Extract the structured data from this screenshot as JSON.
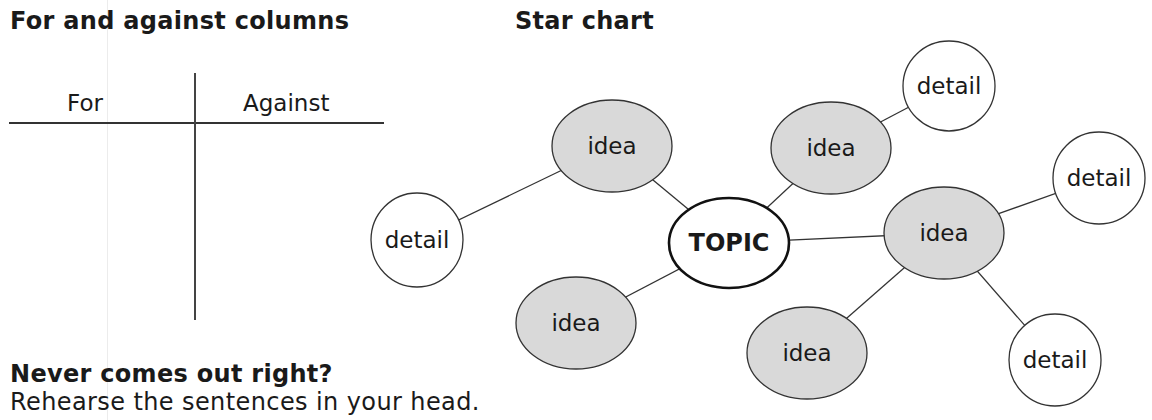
{
  "sections": {
    "for_against": {
      "title": "For and against columns",
      "columns": [
        "For",
        "Against"
      ]
    },
    "star_chart": {
      "title": "Star chart"
    },
    "tip": {
      "title": "Never comes out right?",
      "body": "Rehearse the sentences in your head."
    }
  },
  "colors": {
    "idea_fill": "#d9d9d9",
    "detail_fill": "#ffffff",
    "stroke": "#333333"
  },
  "diagram": {
    "nodes": [
      {
        "id": "topic",
        "label": "TOPIC",
        "type": "topic",
        "cx": 729,
        "cy": 243,
        "rx": 60,
        "ry": 45
      },
      {
        "id": "idea1",
        "label": "idea",
        "type": "idea",
        "cx": 612,
        "cy": 146,
        "rx": 60,
        "ry": 46
      },
      {
        "id": "idea2",
        "label": "idea",
        "type": "idea",
        "cx": 831,
        "cy": 148,
        "rx": 60,
        "ry": 46
      },
      {
        "id": "idea3",
        "label": "idea",
        "type": "idea",
        "cx": 944,
        "cy": 233,
        "rx": 60,
        "ry": 46
      },
      {
        "id": "idea4",
        "label": "idea",
        "type": "idea",
        "cx": 576,
        "cy": 323,
        "rx": 60,
        "ry": 46
      },
      {
        "id": "idea5",
        "label": "idea",
        "type": "idea",
        "cx": 807,
        "cy": 353,
        "rx": 60,
        "ry": 46
      },
      {
        "id": "detail1",
        "label": "detail",
        "type": "detail",
        "cx": 417,
        "cy": 240,
        "rx": 46,
        "ry": 47
      },
      {
        "id": "detail2",
        "label": "detail",
        "type": "detail",
        "cx": 949,
        "cy": 86,
        "rx": 46,
        "ry": 45
      },
      {
        "id": "detail3",
        "label": "detail",
        "type": "detail",
        "cx": 1099,
        "cy": 178,
        "rx": 46,
        "ry": 46
      },
      {
        "id": "detail4",
        "label": "detail",
        "type": "detail",
        "cx": 1055,
        "cy": 360,
        "rx": 46,
        "ry": 46
      }
    ],
    "edges": [
      [
        "topic",
        "idea1"
      ],
      [
        "topic",
        "idea2"
      ],
      [
        "topic",
        "idea3"
      ],
      [
        "topic",
        "idea4"
      ],
      [
        "idea1",
        "detail1"
      ],
      [
        "idea2",
        "detail2"
      ],
      [
        "idea3",
        "detail3"
      ],
      [
        "idea3",
        "idea5"
      ],
      [
        "idea3",
        "detail4"
      ]
    ]
  }
}
